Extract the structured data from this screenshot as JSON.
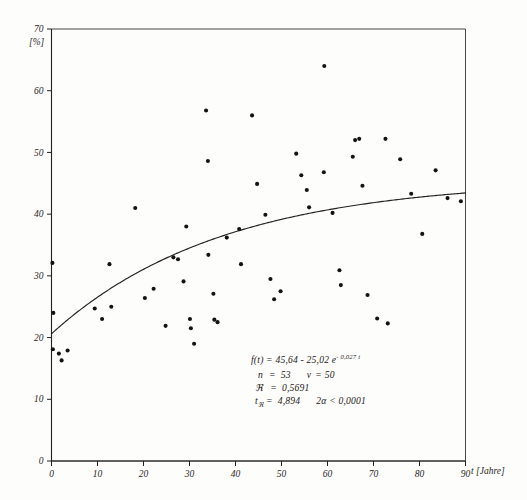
{
  "figure": {
    "scan_header": "",
    "background_color": "#fdfdfc",
    "ink_color": "#151312"
  },
  "axes": {
    "y_unit_label": "[%]",
    "x_axis_label": "t [Jahre]",
    "y_ticks": [
      "0",
      "10",
      "20",
      "30",
      "40",
      "50",
      "60",
      "70"
    ],
    "x_ticks": [
      "0",
      "10",
      "20",
      "30",
      "40",
      "50",
      "60",
      "70",
      "80",
      "90"
    ]
  },
  "annotation": {
    "equation_prefix": "f(t) = 45,64 - 25,02 e",
    "equation_exponent": "- 0,027 t",
    "line_n_label": "n",
    "line_n_eq": "=",
    "line_n_value": "53",
    "line_nu_label": "ν",
    "line_nu_eq": "=",
    "line_nu_value": "50",
    "line_r_label": "ℜ",
    "line_r_eq": "=",
    "line_r_value": "0,5691",
    "line_t_label": "t",
    "line_t_sub": "ℜ",
    "line_t_eq": "=",
    "line_t_value": "4,894",
    "line_alpha": "2α < 0,0001"
  },
  "chart_data": {
    "type": "scatter",
    "title": "",
    "xlabel": "t [Jahre]",
    "ylabel": "[%]",
    "xlim": [
      0,
      90
    ],
    "ylim": [
      0,
      70
    ],
    "grid": false,
    "legend": "none",
    "x_tick_values": [
      0,
      10,
      20,
      30,
      40,
      50,
      60,
      70,
      80,
      90
    ],
    "y_tick_values": [
      0,
      10,
      20,
      30,
      40,
      50,
      60,
      70
    ],
    "series": [
      {
        "name": "observations",
        "n": 53,
        "marker": "filled-circle",
        "points": [
          [
            0.2,
            32.1
          ],
          [
            0.4,
            24.0
          ],
          [
            0.3,
            18.1
          ],
          [
            1.6,
            17.4
          ],
          [
            2.2,
            16.3
          ],
          [
            3.5,
            17.9
          ],
          [
            9.4,
            24.7
          ],
          [
            11.0,
            23.0
          ],
          [
            12.6,
            31.9
          ],
          [
            13.0,
            25.0
          ],
          [
            18.2,
            41.0
          ],
          [
            20.3,
            26.4
          ],
          [
            22.2,
            27.9
          ],
          [
            24.8,
            21.9
          ],
          [
            26.5,
            33.0
          ],
          [
            27.5,
            32.7
          ],
          [
            28.7,
            29.1
          ],
          [
            29.3,
            38.0
          ],
          [
            30.1,
            23.0
          ],
          [
            30.3,
            21.5
          ],
          [
            31.0,
            19.0
          ],
          [
            33.6,
            56.8
          ],
          [
            34.0,
            48.6
          ],
          [
            34.1,
            33.4
          ],
          [
            35.2,
            27.1
          ],
          [
            35.4,
            22.9
          ],
          [
            36.1,
            22.5
          ],
          [
            38.1,
            36.2
          ],
          [
            40.8,
            37.6
          ],
          [
            41.2,
            31.9
          ],
          [
            43.6,
            56.0
          ],
          [
            44.7,
            44.9
          ],
          [
            46.5,
            39.9
          ],
          [
            47.6,
            29.5
          ],
          [
            48.4,
            26.2
          ],
          [
            49.8,
            27.5
          ],
          [
            53.2,
            49.8
          ],
          [
            54.3,
            46.3
          ],
          [
            55.5,
            43.9
          ],
          [
            56.0,
            41.1
          ],
          [
            59.2,
            46.8
          ],
          [
            59.3,
            64.0
          ],
          [
            61.1,
            40.2
          ],
          [
            62.6,
            30.9
          ],
          [
            62.9,
            28.5
          ],
          [
            65.5,
            49.3
          ],
          [
            66.0,
            52.0
          ],
          [
            66.9,
            52.2
          ],
          [
            67.6,
            44.6
          ],
          [
            68.7,
            26.9
          ],
          [
            70.8,
            23.1
          ],
          [
            72.6,
            52.2
          ],
          [
            73.1,
            22.3
          ],
          [
            75.8,
            48.9
          ],
          [
            78.2,
            43.3
          ],
          [
            80.6,
            36.8
          ],
          [
            83.5,
            47.1
          ],
          [
            86.1,
            42.6
          ],
          [
            89.0,
            42.1
          ]
        ]
      }
    ],
    "fit_curve": {
      "name": "regression",
      "model": "f(t) = 45,64 - 25,02 * exp(-0,027 t)",
      "a": 45.64,
      "b": 25.02,
      "c": 0.027,
      "t_start": 0,
      "t_end": 90,
      "statistics": {
        "n": 53,
        "nu": 50,
        "R": 0.5691,
        "t_R": 4.894,
        "two_alpha": "< 0,0001"
      }
    }
  }
}
